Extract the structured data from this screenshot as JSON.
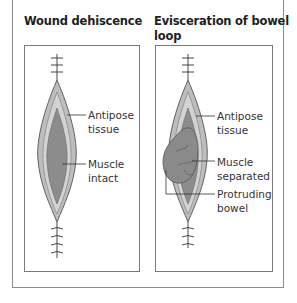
{
  "figure": {
    "panels": [
      {
        "title": "Wound dehiscence",
        "labels": [
          {
            "line1": "Antipose",
            "line2": "tissue"
          },
          {
            "line1": "Muscle",
            "line2": "intact"
          }
        ]
      },
      {
        "title_line1": "Evisceration of bowel",
        "title_line2": "loop",
        "labels": [
          {
            "line1": "Antipose",
            "line2": "tissue"
          },
          {
            "line1": "Muscle",
            "line2": "separated"
          },
          {
            "line1": "Protruding",
            "line2": "bowel"
          }
        ]
      }
    ],
    "colors": {
      "skin": "#bdbdbd",
      "fat": "#d9d9d9",
      "muscle": "#8c8c8c",
      "bowel": "#8a8a8a",
      "outline": "#555555",
      "border": "#8c8c8c"
    }
  }
}
